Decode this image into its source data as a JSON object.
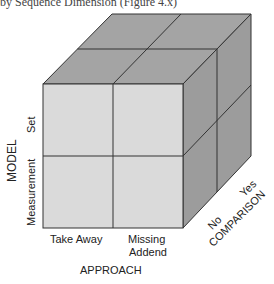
{
  "header_fragment": "by Sequence Dimension (Figure 4.x)",
  "diagram": {
    "type": "3D cube classification",
    "colors": {
      "front": "#dadada",
      "top": "#a4a4a4",
      "side": "#9c9c9c",
      "edge": "#333333"
    },
    "axes": {
      "model": {
        "title": "MODEL",
        "levels": [
          "Measurement",
          "Set"
        ]
      },
      "approach": {
        "title": "APPROACH",
        "levels": [
          "Take Away",
          "Missing Addend"
        ],
        "level_lines": [
          [
            "Take Away"
          ],
          [
            "Missing",
            "Addend"
          ]
        ]
      },
      "comparison": {
        "title": "COMPARISON",
        "levels": [
          "No",
          "Yes"
        ]
      }
    }
  }
}
